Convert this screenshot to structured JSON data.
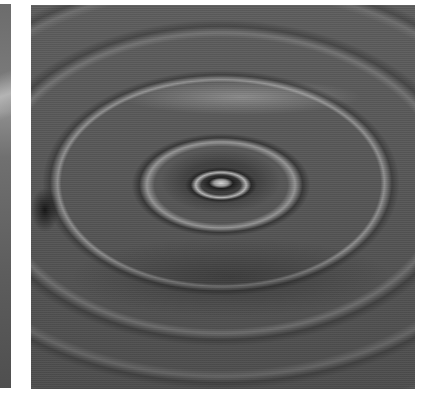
{
  "scene": {
    "description": "Grayscale photograph of concentric water ripples radiating from a droplet impact point",
    "panels": [
      {
        "id": "left-strip",
        "content": "cropped edge of adjacent grayscale ripple image",
        "bounds": {
          "x": 0,
          "y": 4,
          "width": 11,
          "height": 384
        }
      },
      {
        "id": "ripple-photo",
        "content": "water droplet ripple rings, viewed at oblique angle",
        "bounds": {
          "x": 31,
          "y": 5,
          "width": 384,
          "height": 384
        }
      }
    ],
    "colors": {
      "background": "#ffffff",
      "water_mid": "#5a5a5a",
      "water_dark": "#1e1e1e",
      "highlight": "#d8d8d8"
    },
    "ripple_center": {
      "x": 221,
      "y": 183
    }
  }
}
